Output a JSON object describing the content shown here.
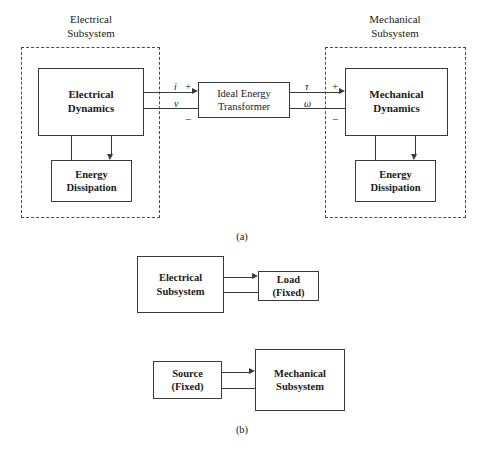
{
  "figure": {
    "panel_a": {
      "caption": "(a)",
      "electrical_subsystem_label": "Electrical\nSubsystem",
      "mechanical_subsystem_label": "Mechanical\nSubsystem",
      "electrical_dynamics_label": "Electrical\nDynamics",
      "mechanical_dynamics_label": "Mechanical\nDynamics",
      "transformer_label": "Ideal Energy\nTransformer",
      "energy_dissipation_left_label": "Energy\nDissipation",
      "energy_dissipation_right_label": "Energy\nDissipation",
      "signals": {
        "current": "i",
        "voltage": "v",
        "torque": "τ",
        "angular_velocity": "ω",
        "plus_left": "+",
        "minus_left": "−",
        "plus_right": "+",
        "minus_right": "−"
      }
    },
    "panel_b": {
      "caption": "(b)",
      "electrical_subsystem_label": "Electrical\nSubsystem",
      "load_label": "Load\n(Fixed)",
      "source_label": "Source\n(Fixed)",
      "mechanical_subsystem_label": "Mechanical\nSubsystem"
    }
  },
  "colors": {
    "background": "#ffffff",
    "stroke": "#3a3a3a",
    "dashed_stroke": "#4a4a4a",
    "text": "#1a1a1a"
  }
}
